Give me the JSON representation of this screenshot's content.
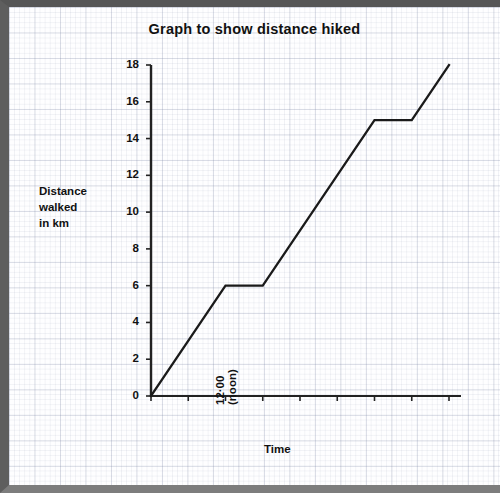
{
  "frame": {
    "border_color": "#5e5e5e",
    "paper_color": "#fefeff"
  },
  "title": "Graph to show distance hiked",
  "axis": {
    "ylabel": "Distance\nwalked\nin km",
    "xlabel": "Time"
  },
  "chart_data": {
    "type": "line",
    "title": "Graph to show distance hiked",
    "xlabel": "Time",
    "ylabel": "Distance walked in km",
    "x": [
      "10-00",
      "11-00",
      "12-00\n(noon)",
      "1-00",
      "2-00",
      "3-00",
      "4-00",
      "5-00",
      "6-00"
    ],
    "xtick_labels": [
      "10·00",
      "11·00",
      "12·00 (noon)",
      "1·00",
      "2·00",
      "3·00",
      "4·00",
      "5·00",
      "6·00"
    ],
    "ytick_labels": [
      "0",
      "2",
      "4",
      "6",
      "8",
      "10",
      "12",
      "14",
      "16",
      "18"
    ],
    "ytick_values": [
      0,
      2,
      4,
      6,
      8,
      10,
      12,
      14,
      16,
      18
    ],
    "ylim": [
      0,
      18
    ],
    "values": [
      0,
      3,
      6,
      6,
      9,
      12,
      15,
      15,
      18
    ],
    "series": [
      {
        "name": "distance hiked",
        "points": [
          {
            "x": "10-00",
            "y": 0
          },
          {
            "x": "12-00",
            "y": 6
          },
          {
            "x": "1-00",
            "y": 6
          },
          {
            "x": "4-00",
            "y": 15
          },
          {
            "x": "5-00",
            "y": 15
          },
          {
            "x": "6-00",
            "y": 18
          }
        ]
      }
    ],
    "grid": "graph-paper",
    "legend": "none",
    "line_color": "#1a1a1a"
  }
}
